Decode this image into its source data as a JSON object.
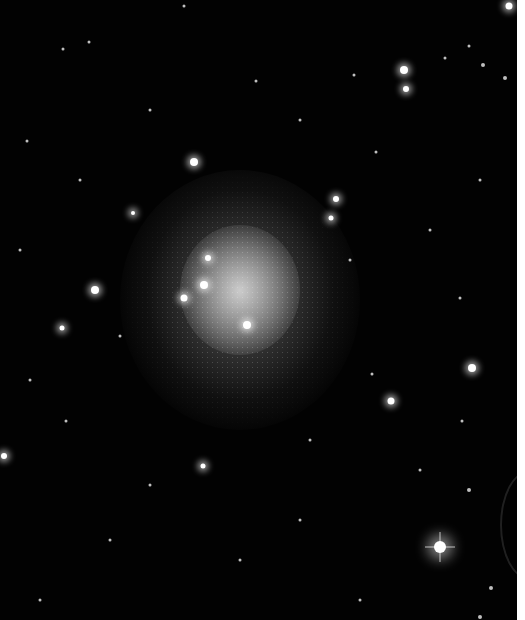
{
  "image": {
    "subject": "dwarf galaxy star field",
    "background_color": "#020202",
    "border_color": "#ffffff"
  },
  "stars": [
    {
      "x": 194,
      "y": 162,
      "r": 4,
      "kind": "glow"
    },
    {
      "x": 404,
      "y": 70,
      "r": 4,
      "kind": "glow"
    },
    {
      "x": 406,
      "y": 89,
      "r": 3,
      "kind": "glow"
    },
    {
      "x": 95,
      "y": 290,
      "r": 4,
      "kind": "glow"
    },
    {
      "x": 62,
      "y": 328,
      "r": 2.5,
      "kind": "glow"
    },
    {
      "x": 472,
      "y": 368,
      "r": 4,
      "kind": "glow"
    },
    {
      "x": 391,
      "y": 401,
      "r": 3.5,
      "kind": "glow"
    },
    {
      "x": 440,
      "y": 547,
      "r": 6,
      "kind": "big"
    },
    {
      "x": 4,
      "y": 456,
      "r": 3,
      "kind": "glow"
    },
    {
      "x": 203,
      "y": 466,
      "r": 2.5,
      "kind": "glow"
    },
    {
      "x": 336,
      "y": 199,
      "r": 3,
      "kind": "glow"
    },
    {
      "x": 331,
      "y": 218,
      "r": 2.5,
      "kind": "glow"
    },
    {
      "x": 184,
      "y": 298,
      "r": 3.5,
      "kind": "glow"
    },
    {
      "x": 204,
      "y": 285,
      "r": 4,
      "kind": "glow"
    },
    {
      "x": 208,
      "y": 258,
      "r": 3,
      "kind": "glow"
    },
    {
      "x": 247,
      "y": 325,
      "r": 4,
      "kind": "glow"
    },
    {
      "x": 133,
      "y": 213,
      "r": 2,
      "kind": "glow"
    },
    {
      "x": 509,
      "y": 6,
      "r": 3.5,
      "kind": "glow"
    },
    {
      "x": 89,
      "y": 42,
      "r": 1.5,
      "kind": "dim"
    },
    {
      "x": 184,
      "y": 6,
      "r": 1.5,
      "kind": "dim"
    },
    {
      "x": 63,
      "y": 49,
      "r": 1.5,
      "kind": "dim"
    },
    {
      "x": 256,
      "y": 81,
      "r": 1.5,
      "kind": "dim"
    },
    {
      "x": 354,
      "y": 75,
      "r": 1.5,
      "kind": "dim"
    },
    {
      "x": 445,
      "y": 58,
      "r": 1.5,
      "kind": "dim"
    },
    {
      "x": 469,
      "y": 46,
      "r": 1.5,
      "kind": "dim"
    },
    {
      "x": 483,
      "y": 65,
      "r": 2,
      "kind": "dim"
    },
    {
      "x": 505,
      "y": 78,
      "r": 2,
      "kind": "dim"
    },
    {
      "x": 27,
      "y": 141,
      "r": 1.5,
      "kind": "dim"
    },
    {
      "x": 376,
      "y": 152,
      "r": 1.5,
      "kind": "dim"
    },
    {
      "x": 460,
      "y": 298,
      "r": 1.5,
      "kind": "dim"
    },
    {
      "x": 372,
      "y": 374,
      "r": 1.5,
      "kind": "dim"
    },
    {
      "x": 462,
      "y": 421,
      "r": 1.5,
      "kind": "dim"
    },
    {
      "x": 469,
      "y": 490,
      "r": 2,
      "kind": "dim"
    },
    {
      "x": 491,
      "y": 588,
      "r": 2,
      "kind": "dim"
    },
    {
      "x": 480,
      "y": 617,
      "r": 2,
      "kind": "dim"
    },
    {
      "x": 120,
      "y": 336,
      "r": 1.5,
      "kind": "dim"
    },
    {
      "x": 66,
      "y": 421,
      "r": 1.5,
      "kind": "dim"
    },
    {
      "x": 150,
      "y": 485,
      "r": 1.5,
      "kind": "dim"
    },
    {
      "x": 300,
      "y": 520,
      "r": 1.5,
      "kind": "dim"
    },
    {
      "x": 240,
      "y": 560,
      "r": 1.5,
      "kind": "dim"
    },
    {
      "x": 110,
      "y": 540,
      "r": 1.5,
      "kind": "dim"
    },
    {
      "x": 40,
      "y": 600,
      "r": 1.5,
      "kind": "dim"
    },
    {
      "x": 360,
      "y": 600,
      "r": 1.5,
      "kind": "dim"
    },
    {
      "x": 420,
      "y": 470,
      "r": 1.5,
      "kind": "dim"
    },
    {
      "x": 20,
      "y": 250,
      "r": 1.5,
      "kind": "dim"
    },
    {
      "x": 430,
      "y": 230,
      "r": 1.5,
      "kind": "dim"
    },
    {
      "x": 480,
      "y": 180,
      "r": 1.5,
      "kind": "dim"
    },
    {
      "x": 300,
      "y": 120,
      "r": 1.5,
      "kind": "dim"
    },
    {
      "x": 150,
      "y": 110,
      "r": 1.5,
      "kind": "dim"
    },
    {
      "x": 30,
      "y": 380,
      "r": 1.5,
      "kind": "dim"
    },
    {
      "x": 350,
      "y": 260,
      "r": 1.5,
      "kind": "dim"
    },
    {
      "x": 310,
      "y": 440,
      "r": 1.5,
      "kind": "dim"
    },
    {
      "x": 80,
      "y": 180,
      "r": 1.5,
      "kind": "dim"
    }
  ]
}
